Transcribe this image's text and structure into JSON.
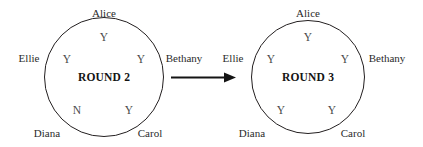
{
  "diagram": {
    "type": "state-transition-diagram",
    "transition_arrow": {
      "icon": "arrow-right-icon",
      "direction": "right",
      "from": "ROUND 2",
      "to": "ROUND 3"
    },
    "participants": [
      "Alice",
      "Bethany",
      "Carol",
      "Diana",
      "Ellie"
    ],
    "colors": {
      "stroke": "#231f20",
      "label_text": "#2b2b2b",
      "vote_text": "#4a4a4a",
      "title_text": "#141414",
      "background": "#ffffff"
    },
    "rounds": [
      {
        "title": "ROUND 2",
        "center_x": 104,
        "center_y": 77,
        "radius": 60,
        "seats": [
          {
            "name": "Alice",
            "vote": "Y",
            "position": "top",
            "label_x": 104,
            "label_y": 13,
            "vote_x": 104,
            "vote_y": 38
          },
          {
            "name": "Bethany",
            "vote": "Y",
            "position": "upper-right",
            "label_x": 184,
            "label_y": 58,
            "vote_x": 141,
            "vote_y": 60
          },
          {
            "name": "Carol",
            "vote": "Y",
            "position": "lower-right",
            "label_x": 150,
            "label_y": 133,
            "vote_x": 129,
            "vote_y": 111
          },
          {
            "name": "Diana",
            "vote": "N",
            "position": "lower-left",
            "label_x": 47,
            "label_y": 133,
            "vote_x": 77,
            "vote_y": 111
          },
          {
            "name": "Ellie",
            "vote": "Y",
            "position": "upper-left",
            "label_x": 29,
            "label_y": 58,
            "vote_x": 67,
            "vote_y": 60
          }
        ]
      },
      {
        "title": "ROUND 3",
        "center_x": 308,
        "center_y": 77,
        "radius": 57,
        "seats": [
          {
            "name": "Alice",
            "vote": "Y",
            "position": "top",
            "label_x": 308,
            "label_y": 13,
            "vote_x": 308,
            "vote_y": 38
          },
          {
            "name": "Bethany",
            "vote": "Y",
            "position": "upper-right",
            "label_x": 387,
            "label_y": 58,
            "vote_x": 345,
            "vote_y": 60
          },
          {
            "name": "Carol",
            "vote": "Y",
            "position": "lower-right",
            "label_x": 353,
            "label_y": 133,
            "vote_x": 332,
            "vote_y": 111
          },
          {
            "name": "Diana",
            "vote": "Y",
            "position": "lower-left",
            "label_x": 252,
            "label_y": 133,
            "vote_x": 281,
            "vote_y": 111
          },
          {
            "name": "Ellie",
            "vote": "Y",
            "position": "upper-left",
            "label_x": 233,
            "label_y": 58,
            "vote_x": 271,
            "vote_y": 60
          }
        ]
      }
    ]
  }
}
